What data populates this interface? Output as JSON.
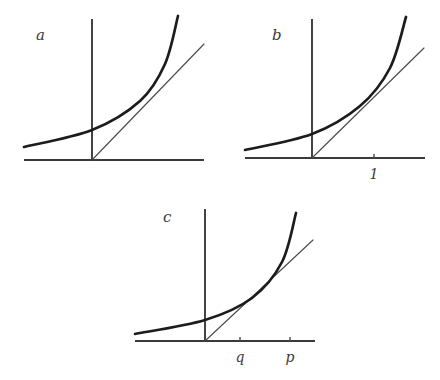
{
  "figure": {
    "background_color": "#ffffff",
    "curve_color": "#1c1c1c",
    "line_color": "#4b4b4b",
    "axis_color": "#3a3a3a",
    "text_color": "#3a3a3a",
    "width": 440,
    "height": 380
  },
  "panels": [
    {
      "id": "a",
      "label": "a",
      "label_pos": {
        "x": 36,
        "y": 40
      },
      "description": "Exponential curve with a straight line through the origin intersecting it",
      "axes": {
        "x_axis": {
          "x1": 24,
          "y1": 160,
          "x2": 204,
          "y2": 160
        },
        "y_axis": {
          "x1": 92,
          "y1": 19,
          "x2": 92,
          "y2": 161
        },
        "origin": {
          "x": 92,
          "y": 160
        }
      },
      "curve": {
        "type": "exponential",
        "start": {
          "x": 24,
          "y": 147
        },
        "end": {
          "x": 178,
          "y": 16
        },
        "control_points": [
          {
            "x": 24,
            "y": 147
          },
          {
            "x": 92,
            "y": 130
          },
          {
            "x": 140,
            "y": 101
          },
          {
            "x": 165,
            "y": 64
          },
          {
            "x": 178,
            "y": 16
          }
        ]
      },
      "line": {
        "type": "ray-from-origin",
        "start": {
          "x": 92,
          "y": 160
        },
        "end": {
          "x": 204,
          "y": 44
        }
      },
      "ticks": []
    },
    {
      "id": "b",
      "label": "b",
      "label_pos": {
        "x": 272,
        "y": 40
      },
      "description": "Exponential curve with a tangent line from the origin touching at x = 1",
      "axes": {
        "x_axis": {
          "x1": 245,
          "y1": 158,
          "x2": 425,
          "y2": 158
        },
        "y_axis": {
          "x1": 312,
          "y1": 19,
          "x2": 312,
          "y2": 159
        },
        "origin": {
          "x": 312,
          "y": 158
        }
      },
      "curve": {
        "type": "exponential",
        "start": {
          "x": 245,
          "y": 150
        },
        "end": {
          "x": 406,
          "y": 17
        },
        "control_points": [
          {
            "x": 245,
            "y": 150
          },
          {
            "x": 312,
            "y": 134
          },
          {
            "x": 360,
            "y": 106
          },
          {
            "x": 390,
            "y": 68
          },
          {
            "x": 406,
            "y": 17
          }
        ]
      },
      "line": {
        "type": "tangent-from-origin",
        "start": {
          "x": 312,
          "y": 158
        },
        "end": {
          "x": 424,
          "y": 48
        }
      },
      "ticks": [
        {
          "label": "1",
          "x": 374,
          "y": 158,
          "label_x": 374,
          "label_y": 179
        }
      ]
    },
    {
      "id": "c",
      "label": "c",
      "label_pos": {
        "x": 163,
        "y": 222
      },
      "description": "Exponential curve with a secant line from the origin crossing at q and p",
      "axes": {
        "x_axis": {
          "x1": 135,
          "y1": 341,
          "x2": 315,
          "y2": 341
        },
        "y_axis": {
          "x1": 205,
          "y1": 209,
          "x2": 205,
          "y2": 342
        },
        "origin": {
          "x": 205,
          "y": 341
        }
      },
      "curve": {
        "type": "exponential",
        "start": {
          "x": 135,
          "y": 334
        },
        "end": {
          "x": 296,
          "y": 213
        },
        "control_points": [
          {
            "x": 135,
            "y": 334
          },
          {
            "x": 205,
            "y": 320
          },
          {
            "x": 252,
            "y": 298
          },
          {
            "x": 282,
            "y": 262
          },
          {
            "x": 296,
            "y": 213
          }
        ]
      },
      "line": {
        "type": "secant-from-origin",
        "start": {
          "x": 205,
          "y": 341
        },
        "end": {
          "x": 313,
          "y": 240
        }
      },
      "ticks": [
        {
          "label": "q",
          "x": 240,
          "y": 341,
          "label_x": 240,
          "label_y": 362
        },
        {
          "label": "p",
          "x": 290,
          "y": 341,
          "label_x": 290,
          "label_y": 362
        }
      ]
    }
  ]
}
